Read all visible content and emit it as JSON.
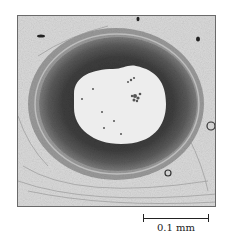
{
  "figure": {
    "scale_bar": {
      "label": "0.1 mm"
    }
  },
  "colors": {
    "background": "#ffffff",
    "tissue_background": "#d9d9d9",
    "lumen": "#eeeeee",
    "media_dark": "#3a3a3a",
    "adventitia": "#8a8a8a",
    "frame_border": "#6a6a6a",
    "text": "#222222"
  }
}
